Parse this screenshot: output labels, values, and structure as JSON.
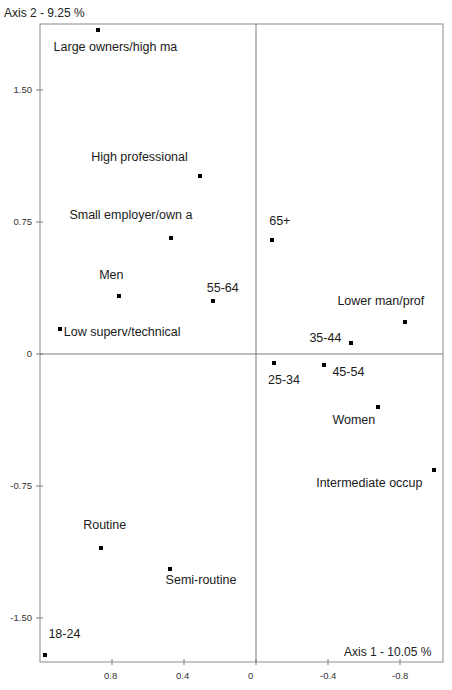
{
  "chart_data": {
    "type": "scatter",
    "title": "",
    "xlabel": "Axis 1  -  10.05 %",
    "ylabel": "Axis 2  -  9.25 %",
    "x_axis_reversed": true,
    "xlim": [
      1.2,
      -1.03
    ],
    "ylim": [
      -1.75,
      1.88
    ],
    "x_ticks": [
      0.8,
      0.4,
      0,
      -0.4,
      -0.8
    ],
    "x_tick_labels": [
      "0.8",
      "0.4",
      "0",
      "-0.4",
      "-0.8"
    ],
    "y_ticks": [
      1.5,
      0.75,
      0,
      -0.75,
      -1.5
    ],
    "y_tick_labels": [
      "1.50",
      "0.75",
      "0",
      "-0.75",
      "-1.50"
    ],
    "grid": false,
    "reference_lines": {
      "x": 0,
      "y": 0
    },
    "legend": null,
    "points": [
      {
        "label": "Large owners/high ma",
        "x": 0.88,
        "y": 1.84
      },
      {
        "label": "High professional",
        "x": 0.31,
        "y": 1.01
      },
      {
        "label": "Small employer/own a",
        "x": 0.47,
        "y": 0.66
      },
      {
        "label": "Men",
        "x": 0.76,
        "y": 0.33
      },
      {
        "label": "55-64",
        "x": 0.24,
        "y": 0.3
      },
      {
        "label": "Low superv/technical",
        "x": 1.09,
        "y": 0.14
      },
      {
        "label": "65+",
        "x": -0.09,
        "y": 0.65
      },
      {
        "label": "Lower man/prof",
        "x": -0.83,
        "y": 0.18
      },
      {
        "label": "35-44",
        "x": -0.53,
        "y": 0.06
      },
      {
        "label": "25-34",
        "x": -0.1,
        "y": -0.05
      },
      {
        "label": "45-54",
        "x": -0.38,
        "y": -0.06
      },
      {
        "label": "Women",
        "x": -0.68,
        "y": -0.3
      },
      {
        "label": "Intermediate occup",
        "x": -0.99,
        "y": -0.66
      },
      {
        "label": "Routine",
        "x": 0.86,
        "y": -1.1
      },
      {
        "label": "Semi-routine",
        "x": 0.48,
        "y": -1.22
      },
      {
        "label": "18-24",
        "x": 1.17,
        "y": -1.71
      }
    ]
  },
  "labels": {
    "y_axis_title": "Axis 2  -  9.25 %",
    "x_axis_title": "Axis 1  -  10.05 %"
  },
  "layout": {
    "label_offsets": [
      {
        "dx": -44,
        "dy": 10
      },
      {
        "dx": -109,
        "dy": -26
      },
      {
        "dx": -102,
        "dy": -30
      },
      {
        "dx": -20,
        "dy": -28
      },
      {
        "dx": -6,
        "dy": -20
      },
      {
        "dx": 4,
        "dy": -4
      },
      {
        "dx": -3,
        "dy": -26
      },
      {
        "dx": -68,
        "dy": -28
      },
      {
        "dx": -42,
        "dy": -12
      },
      {
        "dx": -6,
        "dy": 10
      },
      {
        "dx": 8,
        "dy": 0
      },
      {
        "dx": -46,
        "dy": 6
      },
      {
        "dx": -118,
        "dy": 6
      },
      {
        "dx": -18,
        "dy": -30
      },
      {
        "dx": -4,
        "dy": 4
      },
      {
        "dx": 3,
        "dy": -28
      }
    ]
  },
  "colors": {
    "frame": "#8a8a8a",
    "zero_line": "#7a7a7a",
    "point": "#000000",
    "text": "#1a1a1a"
  }
}
